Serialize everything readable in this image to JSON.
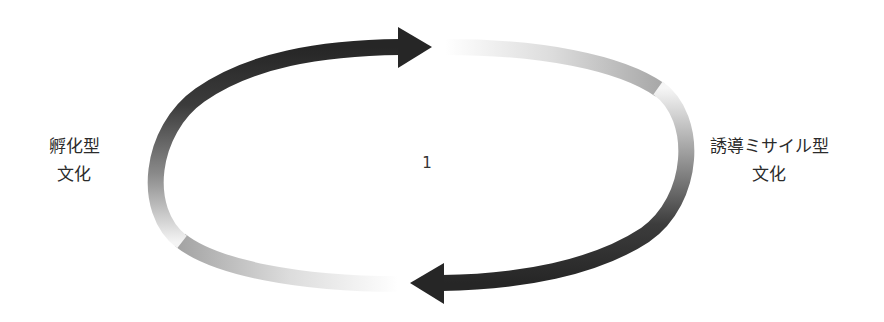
{
  "diagram": {
    "type": "cycle",
    "left_node": {
      "lines": [
        "孵化型",
        "文化"
      ]
    },
    "right_node": {
      "lines": [
        "誘導ミサイル型",
        "文化"
      ]
    },
    "center_label": "1",
    "arrows": [
      {
        "name": "top-arrow",
        "direction": "left-to-right",
        "from": "left_node",
        "to": "right_node"
      },
      {
        "name": "bottom-arrow",
        "direction": "right-to-left",
        "from": "right_node",
        "to": "left_node"
      }
    ],
    "colors": {
      "arrow_dark": "#2a2a2a",
      "arrow_fade": "#ffffff",
      "text": "#2b2b2b"
    }
  }
}
